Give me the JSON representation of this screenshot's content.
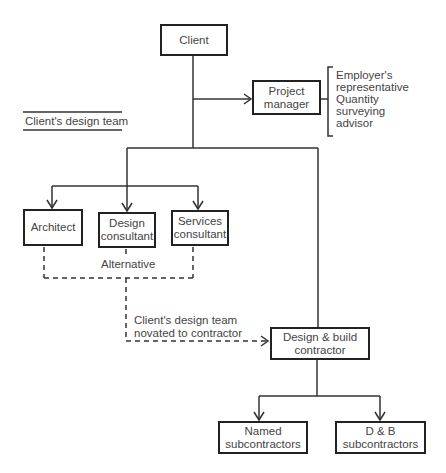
{
  "diagram": {
    "nodes": {
      "client": "Client",
      "project_manager": "Project manager",
      "architect": "Architect",
      "design_consultant": "Design consultant",
      "services_consultant": "Services consultant",
      "design_build_contractor": "Design & build contractor",
      "named_subcontractors": "Named subcontractors",
      "db_subcontractors": "D & B subcontractors"
    },
    "node_lines": {
      "project_manager": [
        "Project",
        "manager"
      ],
      "design_consultant": [
        "Design",
        "consultant"
      ],
      "services_consultant": [
        "Services",
        "consultant"
      ],
      "design_build_contractor": [
        "Design & build",
        "contractor"
      ],
      "named_subcontractors": [
        "Named",
        "subcontractors"
      ],
      "db_subcontractors": [
        "D & B",
        "subcontractors"
      ]
    },
    "pm_roles": [
      "Employer's",
      "representative",
      "Quantity",
      "surveying",
      "advisor"
    ],
    "legend_label": "Client's design team",
    "alternative_label": "Alternative",
    "novation_label": [
      "Client's design team",
      "novated to contractor"
    ],
    "edges": [
      {
        "from": "Client",
        "to": "Project manager",
        "style": "solid"
      },
      {
        "from": "Client",
        "to": "Architect",
        "style": "solid"
      },
      {
        "from": "Client",
        "to": "Design consultant",
        "style": "solid"
      },
      {
        "from": "Client",
        "to": "Services consultant",
        "style": "solid"
      },
      {
        "from": "Client",
        "to": "Design & build contractor",
        "style": "solid"
      },
      {
        "from": "Client's design team",
        "to": "Design & build contractor",
        "style": "dashed"
      },
      {
        "from": "Design & build contractor",
        "to": "Named subcontractors",
        "style": "solid"
      },
      {
        "from": "Design & build contractor",
        "to": "D & B subcontractors",
        "style": "solid"
      }
    ]
  }
}
